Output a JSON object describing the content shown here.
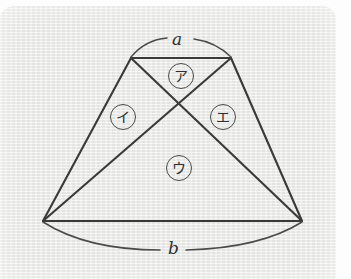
{
  "figure": {
    "stroke_color": "#3a3a3a",
    "paper_color": "#e9e9e7",
    "stroke_width": 2.1
  },
  "side_labels": [
    {
      "id": "top-side",
      "text": "a"
    },
    {
      "id": "bottom-side",
      "text": "b"
    }
  ],
  "region_labels": [
    {
      "id": "region-top",
      "text": "ア"
    },
    {
      "id": "region-left",
      "text": "イ"
    },
    {
      "id": "region-bottom",
      "text": "ウ"
    },
    {
      "id": "region-right",
      "text": "エ"
    }
  ],
  "geometry": {
    "top_left": [
      131,
      58
    ],
    "top_right": [
      231,
      58
    ],
    "bottom_left": [
      43,
      221
    ],
    "bottom_right": [
      302,
      221
    ],
    "intersection": [
      181,
      102
    ]
  }
}
